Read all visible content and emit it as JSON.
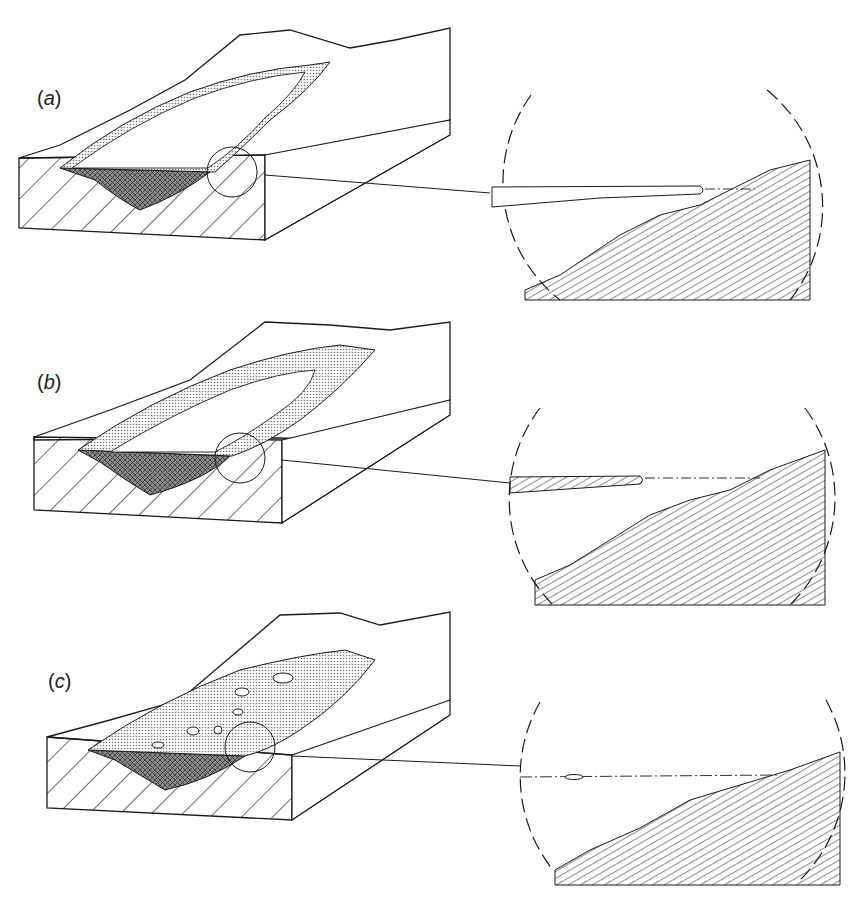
{
  "figure": {
    "panels": [
      {
        "id": "a",
        "label_open": "(",
        "label_letter": "a",
        "label_close": ")",
        "lake_state": "open water with narrow marginal ice fringe",
        "inset": "thick lake ice tapering toward shore"
      },
      {
        "id": "b",
        "label_open": "(",
        "label_letter": "b",
        "label_close": ")",
        "lake_state": "broader marginal ice zone around central open water",
        "inset": "shorter ice wedge near shore"
      },
      {
        "id": "c",
        "label_open": "(",
        "label_letter": "c",
        "label_close": ")",
        "lake_state": "lake nearly fully ice-covered with small openings",
        "inset": "minimal ice lens at water line"
      }
    ],
    "colors": {
      "line": "#1a1a1a",
      "stipple": "#9a9a9a",
      "crosshatch": "#555555",
      "background": "#ffffff"
    }
  }
}
